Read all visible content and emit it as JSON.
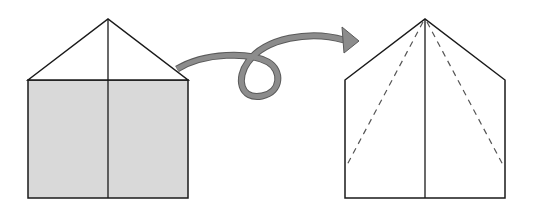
{
  "diagram": {
    "colors": {
      "line": "#1a1a1a",
      "fill_shaded": "#d9d9d9",
      "arrow_fill": "#8c8c8c",
      "arrow_stroke": "#5a5a5a",
      "dashed": "#555555"
    },
    "left_shape": {
      "description": "Paper with top corners folded down to center, lower portion shaded (reverse side)",
      "apex": [
        108,
        19
      ],
      "left_x": 28,
      "right_x": 188,
      "shoulder_y": 80,
      "bottom_y": 198
    },
    "arrow": {
      "description": "Looping arrow indicating turn over the paper",
      "direction": "left-to-right"
    },
    "right_shape": {
      "description": "Turned-over paper with dashed fold lines from apex to sides",
      "apex": [
        425,
        19
      ],
      "left_x": 345,
      "right_x": 505,
      "shoulder_y": 80,
      "bottom_y": 198,
      "dashed_fold_end_y": 165
    }
  }
}
